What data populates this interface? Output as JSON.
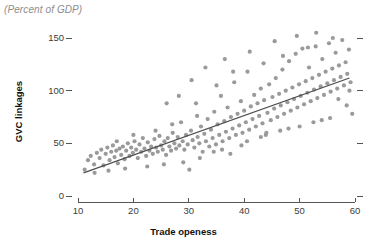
{
  "chart_data": {
    "type": "scatter",
    "title": "(Percent of GDP)",
    "xlabel": "Trade openess",
    "ylabel": "GVC linkages",
    "xlim": [
      10,
      60
    ],
    "ylim": [
      0,
      160
    ],
    "xticks": [
      10,
      20,
      30,
      40,
      50,
      60
    ],
    "xtick_labels": [
      "10",
      "20",
      "30",
      "40",
      "50",
      "60"
    ],
    "yticks": [
      0,
      50,
      100,
      150
    ],
    "ytick_labels": [
      "0",
      "50",
      "100",
      "150"
    ],
    "grid": false,
    "legend": null,
    "right_axis_ticks": [
      0,
      50,
      100,
      150
    ],
    "marker_color": "#9a9a9a",
    "line_color": "#4d4d4d",
    "trendline": {
      "x": [
        11.0,
        59.0
      ],
      "y": [
        22.0,
        112.0
      ]
    },
    "points": [
      {
        "x": 11.2,
        "y": 25
      },
      {
        "x": 11.8,
        "y": 34
      },
      {
        "x": 12.3,
        "y": 38
      },
      {
        "x": 12.9,
        "y": 30
      },
      {
        "x": 13.4,
        "y": 41
      },
      {
        "x": 13.9,
        "y": 36
      },
      {
        "x": 14.2,
        "y": 44
      },
      {
        "x": 14.6,
        "y": 29
      },
      {
        "x": 15.0,
        "y": 40
      },
      {
        "x": 15.3,
        "y": 46
      },
      {
        "x": 15.7,
        "y": 34
      },
      {
        "x": 16.0,
        "y": 42
      },
      {
        "x": 16.3,
        "y": 48
      },
      {
        "x": 16.6,
        "y": 37
      },
      {
        "x": 16.9,
        "y": 43
      },
      {
        "x": 17.2,
        "y": 31
      },
      {
        "x": 17.5,
        "y": 45
      },
      {
        "x": 17.8,
        "y": 39
      },
      {
        "x": 18.1,
        "y": 47
      },
      {
        "x": 18.4,
        "y": 35
      },
      {
        "x": 18.7,
        "y": 43
      },
      {
        "x": 19.0,
        "y": 50
      },
      {
        "x": 19.3,
        "y": 38
      },
      {
        "x": 19.6,
        "y": 46
      },
      {
        "x": 19.9,
        "y": 41
      },
      {
        "x": 20.2,
        "y": 52
      },
      {
        "x": 20.5,
        "y": 44
      },
      {
        "x": 20.8,
        "y": 36
      },
      {
        "x": 21.1,
        "y": 49
      },
      {
        "x": 21.4,
        "y": 42
      },
      {
        "x": 21.7,
        "y": 55
      },
      {
        "x": 22.0,
        "y": 45
      },
      {
        "x": 22.3,
        "y": 38
      },
      {
        "x": 22.6,
        "y": 51
      },
      {
        "x": 22.9,
        "y": 43
      },
      {
        "x": 23.2,
        "y": 47
      },
      {
        "x": 23.5,
        "y": 40
      },
      {
        "x": 23.8,
        "y": 54
      },
      {
        "x": 24.1,
        "y": 46
      },
      {
        "x": 24.4,
        "y": 42
      },
      {
        "x": 24.7,
        "y": 57
      },
      {
        "x": 25.0,
        "y": 48
      },
      {
        "x": 25.3,
        "y": 44
      },
      {
        "x": 25.6,
        "y": 52
      },
      {
        "x": 25.9,
        "y": 39
      },
      {
        "x": 26.2,
        "y": 55
      },
      {
        "x": 26.5,
        "y": 47
      },
      {
        "x": 26.8,
        "y": 43
      },
      {
        "x": 27.1,
        "y": 60
      },
      {
        "x": 27.4,
        "y": 50
      },
      {
        "x": 27.7,
        "y": 45
      },
      {
        "x": 28.0,
        "y": 56
      },
      {
        "x": 28.3,
        "y": 48
      },
      {
        "x": 28.6,
        "y": 70
      },
      {
        "x": 28.9,
        "y": 52
      },
      {
        "x": 29.2,
        "y": 44
      },
      {
        "x": 29.5,
        "y": 58
      },
      {
        "x": 29.8,
        "y": 49
      },
      {
        "x": 30.1,
        "y": 25
      },
      {
        "x": 30.4,
        "y": 62
      },
      {
        "x": 30.7,
        "y": 53
      },
      {
        "x": 31.0,
        "y": 46
      },
      {
        "x": 31.3,
        "y": 88
      },
      {
        "x": 31.6,
        "y": 56
      },
      {
        "x": 31.9,
        "y": 50
      },
      {
        "x": 32.2,
        "y": 66
      },
      {
        "x": 32.5,
        "y": 42
      },
      {
        "x": 32.8,
        "y": 59
      },
      {
        "x": 33.1,
        "y": 52
      },
      {
        "x": 33.4,
        "y": 73
      },
      {
        "x": 33.7,
        "y": 47
      },
      {
        "x": 34.0,
        "y": 63
      },
      {
        "x": 34.3,
        "y": 55
      },
      {
        "x": 34.6,
        "y": 80
      },
      {
        "x": 34.9,
        "y": 49
      },
      {
        "x": 35.2,
        "y": 68
      },
      {
        "x": 35.5,
        "y": 58
      },
      {
        "x": 35.8,
        "y": 95
      },
      {
        "x": 36.1,
        "y": 52
      },
      {
        "x": 36.4,
        "y": 71
      },
      {
        "x": 36.7,
        "y": 61
      },
      {
        "x": 37.0,
        "y": 84
      },
      {
        "x": 37.3,
        "y": 55
      },
      {
        "x": 37.6,
        "y": 75
      },
      {
        "x": 37.9,
        "y": 64
      },
      {
        "x": 38.2,
        "y": 108
      },
      {
        "x": 38.5,
        "y": 58
      },
      {
        "x": 38.8,
        "y": 78
      },
      {
        "x": 39.1,
        "y": 67
      },
      {
        "x": 39.4,
        "y": 90
      },
      {
        "x": 39.7,
        "y": 60
      },
      {
        "x": 40.0,
        "y": 81
      },
      {
        "x": 40.3,
        "y": 70
      },
      {
        "x": 40.6,
        "y": 118
      },
      {
        "x": 40.9,
        "y": 63
      },
      {
        "x": 41.2,
        "y": 85
      },
      {
        "x": 41.5,
        "y": 73
      },
      {
        "x": 41.8,
        "y": 96
      },
      {
        "x": 42.1,
        "y": 66
      },
      {
        "x": 42.4,
        "y": 88
      },
      {
        "x": 42.7,
        "y": 76
      },
      {
        "x": 43.0,
        "y": 102
      },
      {
        "x": 43.3,
        "y": 69
      },
      {
        "x": 43.6,
        "y": 91
      },
      {
        "x": 43.9,
        "y": 58
      },
      {
        "x": 44.2,
        "y": 79
      },
      {
        "x": 44.5,
        "y": 106
      },
      {
        "x": 44.8,
        "y": 72
      },
      {
        "x": 45.1,
        "y": 94
      },
      {
        "x": 45.4,
        "y": 83
      },
      {
        "x": 45.7,
        "y": 112
      },
      {
        "x": 46.0,
        "y": 75
      },
      {
        "x": 46.3,
        "y": 97
      },
      {
        "x": 46.6,
        "y": 86
      },
      {
        "x": 46.9,
        "y": 120
      },
      {
        "x": 47.2,
        "y": 78
      },
      {
        "x": 47.5,
        "y": 100
      },
      {
        "x": 47.8,
        "y": 89
      },
      {
        "x": 48.1,
        "y": 128
      },
      {
        "x": 48.4,
        "y": 81
      },
      {
        "x": 48.7,
        "y": 103
      },
      {
        "x": 49.0,
        "y": 92
      },
      {
        "x": 49.3,
        "y": 135
      },
      {
        "x": 49.6,
        "y": 84
      },
      {
        "x": 49.9,
        "y": 106
      },
      {
        "x": 50.2,
        "y": 95
      },
      {
        "x": 50.5,
        "y": 140
      },
      {
        "x": 50.8,
        "y": 87
      },
      {
        "x": 51.1,
        "y": 109
      },
      {
        "x": 51.4,
        "y": 98
      },
      {
        "x": 51.7,
        "y": 122
      },
      {
        "x": 52.0,
        "y": 90
      },
      {
        "x": 52.3,
        "y": 112
      },
      {
        "x": 52.6,
        "y": 101
      },
      {
        "x": 52.9,
        "y": 142
      },
      {
        "x": 53.2,
        "y": 93
      },
      {
        "x": 53.5,
        "y": 115
      },
      {
        "x": 53.8,
        "y": 104
      },
      {
        "x": 54.1,
        "y": 130
      },
      {
        "x": 54.4,
        "y": 96
      },
      {
        "x": 54.7,
        "y": 118
      },
      {
        "x": 55.0,
        "y": 107
      },
      {
        "x": 55.3,
        "y": 145
      },
      {
        "x": 55.6,
        "y": 99
      },
      {
        "x": 55.9,
        "y": 121
      },
      {
        "x": 56.2,
        "y": 110
      },
      {
        "x": 56.5,
        "y": 136
      },
      {
        "x": 56.8,
        "y": 102
      },
      {
        "x": 57.1,
        "y": 124
      },
      {
        "x": 57.4,
        "y": 113
      },
      {
        "x": 57.7,
        "y": 148
      },
      {
        "x": 58.0,
        "y": 105
      },
      {
        "x": 58.3,
        "y": 127
      },
      {
        "x": 58.6,
        "y": 116
      },
      {
        "x": 58.9,
        "y": 139
      },
      {
        "x": 59.2,
        "y": 108
      },
      {
        "x": 26.0,
        "y": 88
      },
      {
        "x": 28.2,
        "y": 95
      },
      {
        "x": 30.5,
        "y": 110
      },
      {
        "x": 33.0,
        "y": 122
      },
      {
        "x": 35.0,
        "y": 105
      },
      {
        "x": 36.5,
        "y": 130
      },
      {
        "x": 38.0,
        "y": 118
      },
      {
        "x": 41.0,
        "y": 137
      },
      {
        "x": 43.5,
        "y": 126
      },
      {
        "x": 45.5,
        "y": 147
      },
      {
        "x": 47.0,
        "y": 133
      },
      {
        "x": 49.5,
        "y": 152
      },
      {
        "x": 51.5,
        "y": 141
      },
      {
        "x": 53.0,
        "y": 155
      },
      {
        "x": 56.0,
        "y": 150
      },
      {
        "x": 57.0,
        "y": 92
      },
      {
        "x": 58.5,
        "y": 86
      },
      {
        "x": 59.5,
        "y": 78
      },
      {
        "x": 54.0,
        "y": 72
      },
      {
        "x": 50.0,
        "y": 66
      },
      {
        "x": 46.5,
        "y": 62
      },
      {
        "x": 43.0,
        "y": 56
      },
      {
        "x": 39.5,
        "y": 48
      },
      {
        "x": 36.0,
        "y": 44
      },
      {
        "x": 32.0,
        "y": 36
      },
      {
        "x": 29.0,
        "y": 32
      },
      {
        "x": 25.5,
        "y": 30
      },
      {
        "x": 22.5,
        "y": 28
      },
      {
        "x": 18.5,
        "y": 26
      },
      {
        "x": 15.5,
        "y": 24
      },
      {
        "x": 13.0,
        "y": 22
      },
      {
        "x": 17.0,
        "y": 52
      },
      {
        "x": 20.0,
        "y": 58
      },
      {
        "x": 24.0,
        "y": 62
      },
      {
        "x": 27.0,
        "y": 68
      },
      {
        "x": 31.5,
        "y": 76
      },
      {
        "x": 34.5,
        "y": 42
      },
      {
        "x": 37.5,
        "y": 40
      },
      {
        "x": 40.5,
        "y": 52
      },
      {
        "x": 44.0,
        "y": 60
      },
      {
        "x": 48.0,
        "y": 64
      },
      {
        "x": 52.5,
        "y": 70
      },
      {
        "x": 55.5,
        "y": 74
      },
      {
        "x": 59.0,
        "y": 100
      }
    ]
  }
}
